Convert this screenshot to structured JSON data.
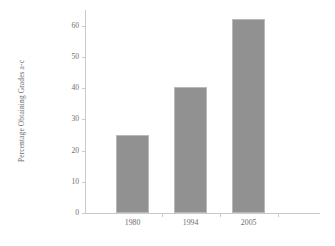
{
  "chart_data": {
    "type": "bar",
    "title": "",
    "xlabel": "",
    "ylabel": "Percentage Obtaining Grades a-c",
    "categories": [
      "1980",
      "1994",
      "2005"
    ],
    "values": [
      25,
      40.3,
      62
    ],
    "ylim": [
      0,
      65
    ],
    "yticks": [
      0,
      10,
      20,
      30,
      40,
      50,
      60
    ],
    "ytick_labels": [
      "0",
      "10",
      "20",
      "30",
      "40",
      "50",
      "60"
    ],
    "grid": false,
    "legend": null,
    "bar_color": "#919191",
    "bar_border_color": "#b9b9b9",
    "axis_color": "#c9c9c9",
    "text_color": "#6e6e6e",
    "background": "#ffffff"
  }
}
